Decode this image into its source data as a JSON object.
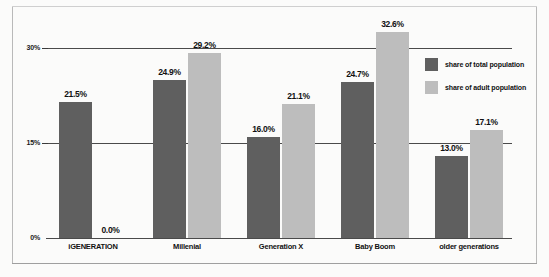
{
  "chart_data": {
    "type": "bar",
    "title": "",
    "xlabel": "",
    "ylabel": "",
    "ylim": [
      0,
      35
    ],
    "yticks": [
      "0%",
      "15%",
      "30%"
    ],
    "ytick_values": [
      0,
      15,
      30
    ],
    "grid": true,
    "legend_position": "right",
    "categories": [
      "iGENERATION",
      "Millenial",
      "Generation X",
      "Baby Boom",
      "older generations"
    ],
    "series": [
      {
        "name": "share of total population",
        "color": "#5f5f5f",
        "values": [
          21.5,
          24.9,
          16.0,
          24.7,
          13.0
        ],
        "labels": [
          "21.5%",
          "24.9%",
          "16.0%",
          "24.7%",
          "13.0%"
        ]
      },
      {
        "name": "share of adult population",
        "color": "#bdbdbd",
        "values": [
          0.0,
          29.2,
          21.1,
          32.6,
          17.1
        ],
        "labels": [
          "0.0%",
          "29.2%",
          "21.1%",
          "32.6%",
          "17.1%"
        ]
      }
    ]
  }
}
